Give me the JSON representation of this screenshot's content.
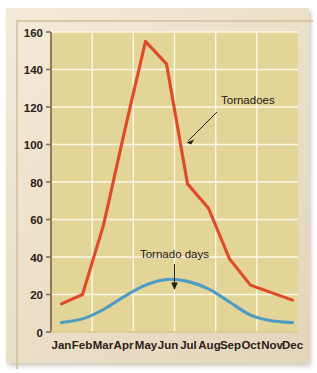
{
  "figure": {
    "frame_color": "#ece0c9",
    "plot_background": "#e5d79c",
    "gridline_color": "#fdf8e6",
    "axis_color": "#8a6f4a"
  },
  "chart_data": {
    "type": "line",
    "title": "",
    "subtitle": "",
    "xlabel": "",
    "ylabel": "",
    "categories": [
      "Jan",
      "Feb",
      "Mar",
      "Apr",
      "May",
      "Jun",
      "Jul",
      "Aug",
      "Sep",
      "Oct",
      "Nov",
      "Dec"
    ],
    "ylim": [
      0,
      160
    ],
    "ytick_values": [
      0,
      20,
      40,
      60,
      80,
      100,
      120,
      140,
      160
    ],
    "ytick_labels": [
      "0",
      "20",
      "40",
      "60",
      "80",
      "100",
      "120",
      "140",
      "160"
    ],
    "grid": true,
    "grid_axis": "both",
    "legend": "none",
    "legend_position": "inline-annotations",
    "series": [
      {
        "name": "Tornadoes",
        "color": "#e04a28",
        "values": [
          15,
          20,
          57,
          107,
          155,
          143,
          79,
          66,
          39,
          25,
          21,
          17
        ]
      },
      {
        "name": "Tornado days",
        "color": "#4e9cc4",
        "values": [
          5,
          7,
          12,
          19,
          25,
          28,
          27,
          23,
          16,
          9,
          6,
          5
        ]
      }
    ],
    "annotations": [
      {
        "label": "Tornadoes",
        "target_category": "Jul",
        "target_value": 107,
        "arrow": "diagonal-down-left"
      },
      {
        "label": "Tornado days",
        "target_category": "Jun",
        "target_value": 28,
        "arrow": "vertical-down"
      }
    ]
  }
}
